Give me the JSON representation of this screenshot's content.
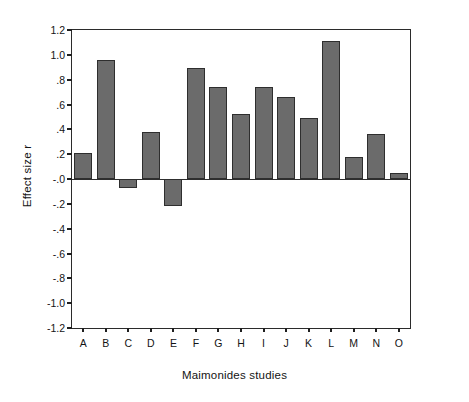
{
  "chart_data": {
    "type": "bar",
    "title": "",
    "xlabel": "Maimonides studies",
    "ylabel": "Effect size r",
    "categories": [
      "A",
      "B",
      "C",
      "D",
      "E",
      "F",
      "G",
      "H",
      "I",
      "J",
      "K",
      "L",
      "M",
      "N",
      "O"
    ],
    "values": [
      0.21,
      0.96,
      -0.07,
      0.38,
      -0.22,
      0.89,
      0.74,
      0.52,
      0.74,
      0.66,
      0.49,
      1.11,
      0.18,
      0.36,
      0.05
    ],
    "ylim": [
      -1.2,
      1.2
    ],
    "ytick_values": [
      1.2,
      1.0,
      0.8,
      0.6,
      0.4,
      0.2,
      0.0,
      -0.2,
      -0.4,
      -0.6,
      -0.8,
      -1.0,
      -1.2
    ],
    "ytick_labels": [
      "1.2",
      "1.0",
      ".8",
      ".6",
      ".4",
      ".2",
      "-.0",
      "-.2",
      "-.4",
      "-.6",
      "-.8",
      "-1.0",
      "-1.2"
    ],
    "grid": false,
    "legend": false,
    "bar_color": "#6b6b6b",
    "bar_edge_color": "#2e2e2e",
    "axis_color": "#2b2b2b",
    "background_color": "#ffffff"
  }
}
